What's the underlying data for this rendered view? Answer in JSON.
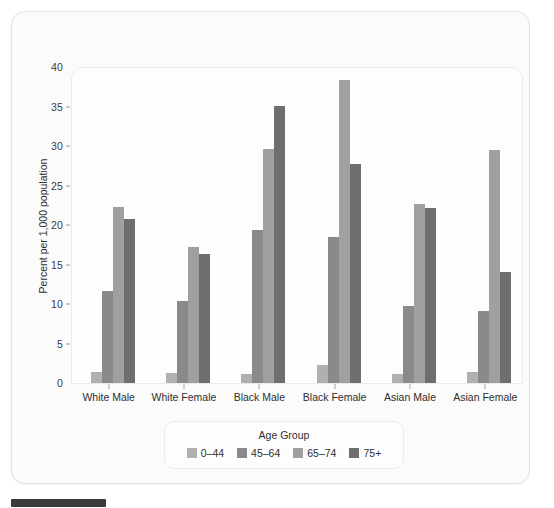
{
  "chart_data": {
    "type": "bar",
    "title": "",
    "xlabel": "",
    "ylabel": "Percent per 1,000 population",
    "legend_title": "Age Group",
    "legend_position": "bottom",
    "grid": false,
    "ylim": [
      0,
      40
    ],
    "yticks": [
      0,
      5,
      10,
      15,
      20,
      25,
      30,
      35,
      40
    ],
    "ytick_labels": [
      "0",
      "5",
      "10",
      "15",
      "20",
      "25",
      "30",
      "35",
      "40"
    ],
    "categories": [
      "White Male",
      "White Female",
      "Black Male",
      "Black Female",
      "Asian Male",
      "Asian Female"
    ],
    "series": [
      {
        "name": "0–44",
        "color": "#b0b0b0",
        "values": [
          1.4,
          1.3,
          1.2,
          2.3,
          1.2,
          1.4
        ]
      },
      {
        "name": "45–64",
        "color": "#8a8a8a",
        "values": [
          11.7,
          10.4,
          19.4,
          18.5,
          9.8,
          9.1
        ]
      },
      {
        "name": "65–74",
        "color": "#a0a0a0",
        "values": [
          22.3,
          17.2,
          29.6,
          38.4,
          22.6,
          29.5
        ]
      },
      {
        "name": "75+",
        "color": "#6e6e6e",
        "values": [
          20.8,
          16.3,
          35.1,
          27.7,
          22.1,
          14.1
        ]
      }
    ]
  },
  "legend": {
    "title": "Age Group",
    "items": [
      {
        "label": "0–44",
        "color": "#b0b0b0"
      },
      {
        "label": "45–64",
        "color": "#8a8a8a"
      },
      {
        "label": "65–74",
        "color": "#a0a0a0"
      },
      {
        "label": "75+",
        "color": "#6e6e6e"
      }
    ]
  },
  "axes": {
    "y_title": "Percent per 1,000 population",
    "y_labels": [
      "40",
      "35",
      "30",
      "25",
      "20",
      "15",
      "10",
      "5",
      "0"
    ],
    "x_labels": [
      "White Male",
      "White Female",
      "Black Male",
      "Black Female",
      "Asian Male",
      "Asian Female"
    ]
  },
  "colors": {
    "page_background": "#ffffff",
    "card_background": "#fbfbfb",
    "panel_background": "#fdfdfd",
    "border": "#e2e2e2",
    "text": "#2f2f2f",
    "bottom_strip": "#3a3a3a"
  }
}
